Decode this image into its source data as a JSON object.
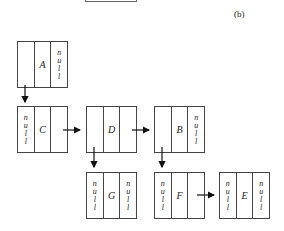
{
  "figure_label": "(b)",
  "null_text": [
    "n",
    "u",
    "l",
    "l"
  ],
  "nodes": {
    "A": {
      "value": "A",
      "left": "",
      "right": "null"
    },
    "C": {
      "value": "C",
      "left": "null",
      "right": ""
    },
    "D": {
      "value": "D",
      "left": "",
      "right": ""
    },
    "B": {
      "value": "B",
      "left": "",
      "right": "null"
    },
    "G": {
      "value": "G",
      "left": "null",
      "right": "null"
    },
    "F": {
      "value": "F",
      "left": "null",
      "right": ""
    },
    "E": {
      "value": "E",
      "left": "null",
      "right": "null"
    }
  },
  "edges": [
    {
      "from": "A",
      "to": "C",
      "direction": "down"
    },
    {
      "from": "C",
      "to": "D",
      "direction": "right"
    },
    {
      "from": "D",
      "to": "B",
      "direction": "right"
    },
    {
      "from": "D",
      "to": "G",
      "direction": "down"
    },
    {
      "from": "B",
      "to": "F",
      "direction": "down"
    },
    {
      "from": "F",
      "to": "E",
      "direction": "right"
    }
  ]
}
